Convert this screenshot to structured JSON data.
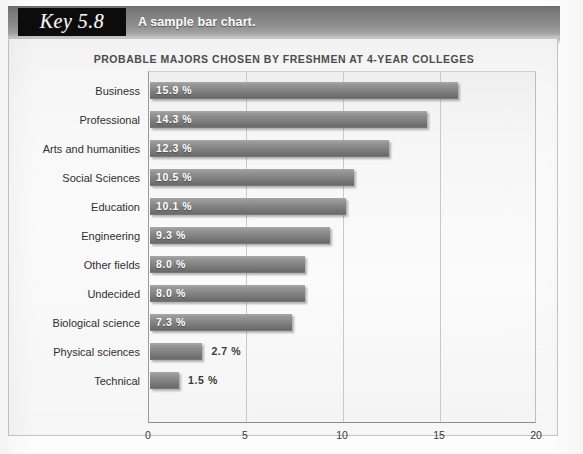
{
  "header": {
    "key_label": "Key 5.8",
    "caption": "A sample bar chart."
  },
  "chart_data": {
    "type": "bar",
    "orientation": "horizontal",
    "title": "PROBABLE MAJORS CHOSEN BY FRESHMEN AT 4-YEAR COLLEGES",
    "xlabel": "",
    "ylabel": "",
    "xlim": [
      0,
      20
    ],
    "xticks": [
      "0",
      "5",
      "10",
      "15",
      "20"
    ],
    "xtick_values": [
      0,
      5,
      10,
      15,
      20
    ],
    "grid": true,
    "legend": "none",
    "value_suffix": "%",
    "categories": [
      "Business",
      "Professional",
      "Arts and humanities",
      "Social Sciences",
      "Education",
      "Engineering",
      "Other fields",
      "Undecided",
      "Biological science",
      "Physical sciences",
      "Technical"
    ],
    "values": [
      15.9,
      14.3,
      12.3,
      10.5,
      10.1,
      9.3,
      8.0,
      8.0,
      7.3,
      2.7,
      1.5
    ],
    "labels": [
      "15.9 %",
      "14.3 %",
      "12.3 %",
      "10.5 %",
      "10.1 %",
      "9.3 %",
      "8.0 %",
      "8.0 %",
      "7.3 %",
      "2.7 %",
      "1.5 %"
    ],
    "bar_color": "#8a8a8a",
    "value_text_color_inside": "#ffffff",
    "value_text_color_outside": "#3a3a3a"
  },
  "footnote": {
    "text": ""
  }
}
